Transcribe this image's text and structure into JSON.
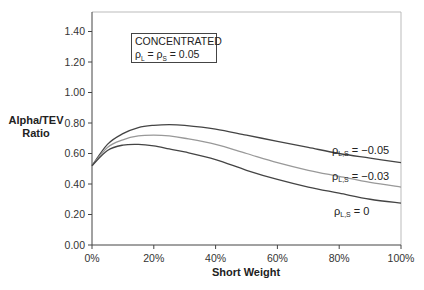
{
  "chart_data": {
    "type": "line",
    "title": "",
    "xlabel": "Short Weight",
    "ylabel": "Alpha/TEV Ratio",
    "ylabel_lines": [
      "Alpha/TEV",
      "Ratio"
    ],
    "xlim": [
      0,
      100
    ],
    "ylim": [
      0,
      1.4
    ],
    "x_ticks": [
      "0%",
      "20%",
      "40%",
      "60%",
      "80%",
      "100%"
    ],
    "y_ticks": [
      "0.00",
      "0.20",
      "0.40",
      "0.60",
      "0.80",
      "1.00",
      "1.20",
      "1.40"
    ],
    "grid": false,
    "legend": "none (inline series labels)",
    "annotation": {
      "line1": "CONCENTRATED",
      "line2_prefix": "ρ",
      "line2_sub1": "L",
      "line2_mid": " = ρ",
      "line2_sub2": "S",
      "line2_suffix": " = 0.05",
      "text": "CONCENTRATED ρL = ρS = 0.05"
    },
    "x": [
      0,
      5,
      10,
      15,
      20,
      25,
      30,
      40,
      50,
      60,
      70,
      80,
      90,
      100
    ],
    "series": [
      {
        "name": "ρL,S = −0.05",
        "label_prefix": "ρ",
        "label_sub": "L,S",
        "label_suffix": " = −0.05",
        "color": "#444444",
        "values": [
          0.52,
          0.66,
          0.73,
          0.77,
          0.785,
          0.79,
          0.785,
          0.76,
          0.72,
          0.68,
          0.64,
          0.6,
          0.57,
          0.54
        ]
      },
      {
        "name": "ρL,S = −0.03",
        "label_prefix": "ρ",
        "label_sub": "L,S",
        "label_suffix": " = −0.03",
        "color": "#999999",
        "values": [
          0.52,
          0.64,
          0.69,
          0.715,
          0.72,
          0.715,
          0.7,
          0.66,
          0.6,
          0.54,
          0.49,
          0.45,
          0.41,
          0.38
        ]
      },
      {
        "name": "ρL,S = 0",
        "label_prefix": "ρ",
        "label_sub": "L,S",
        "label_suffix": " = 0",
        "color": "#444444",
        "values": [
          0.52,
          0.62,
          0.655,
          0.66,
          0.65,
          0.63,
          0.61,
          0.56,
          0.49,
          0.43,
          0.38,
          0.34,
          0.3,
          0.275
        ]
      }
    ]
  }
}
